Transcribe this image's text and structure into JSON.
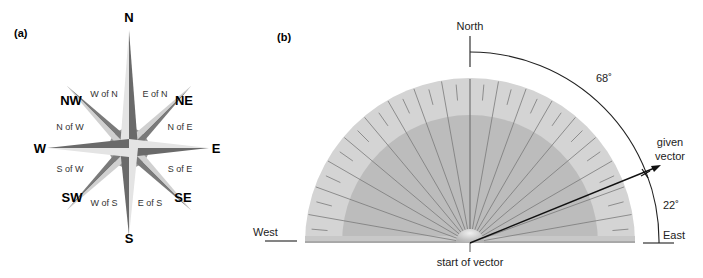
{
  "panel_a": {
    "label": "(a)",
    "cardinals": {
      "N": "N",
      "NE": "NE",
      "E": "E",
      "SE": "SE",
      "S": "S",
      "SW": "SW",
      "W": "W",
      "NW": "NW"
    },
    "sub_labels": {
      "w_of_n": "W of N",
      "e_of_n": "E of N",
      "n_of_w": "N of W",
      "n_of_e": "N of E",
      "s_of_w": "S of W",
      "s_of_e": "S of E",
      "w_of_s": "W of S",
      "e_of_s": "E of S"
    }
  },
  "panel_b": {
    "label": "(b)",
    "north": "North",
    "west": "West",
    "east": "East",
    "given_vector_line1": "given",
    "given_vector_line2": "vector",
    "start_of_vector": "start of vector",
    "angle_from_north": "68˚",
    "angle_from_east": "22˚"
  }
}
